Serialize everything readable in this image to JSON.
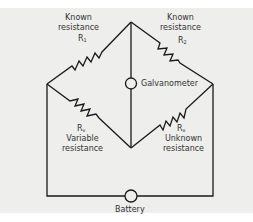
{
  "diagram": {
    "background": "#eeeeec",
    "line_color": "#1a1a1a",
    "components": {
      "r1": {
        "label_line1": "Known",
        "label_line2": "resistance",
        "symbol": "R",
        "subscript": "1"
      },
      "r2": {
        "label_line1": "Known",
        "label_line2": "resistance",
        "symbol": "R",
        "subscript": "2"
      },
      "rv": {
        "label_line1": "Variable",
        "label_line2": "resistance",
        "symbol": "R",
        "subscript": "v"
      },
      "rx": {
        "label_line1": "Unknown",
        "label_line2": "resistance",
        "symbol": "R",
        "subscript": "x"
      },
      "galvanometer": {
        "label": "Galvanometer"
      },
      "battery": {
        "label": "Battery"
      }
    }
  }
}
